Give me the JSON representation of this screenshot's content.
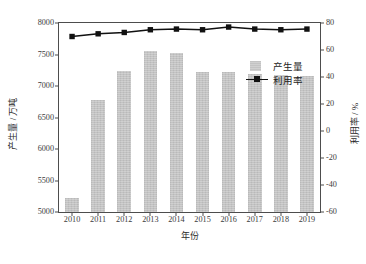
{
  "chart_data": {
    "type": "bar",
    "title": "",
    "subtitle": "",
    "xlabel": "年份",
    "ylabel": "产生量 / 万吨",
    "ylabel_secondary": "利用率 / %",
    "categories": [
      "2010",
      "2011",
      "2012",
      "2013",
      "2014",
      "2015",
      "2016",
      "2017",
      "2018",
      "2019"
    ],
    "ylim": [
      5000,
      8000
    ],
    "yticks": [
      5000,
      5500,
      6000,
      6500,
      7000,
      7500,
      8000
    ],
    "ylim_secondary": [
      -60,
      80
    ],
    "yticks_secondary": [
      -60,
      -40,
      -20,
      0,
      20,
      40,
      60,
      80
    ],
    "grid": false,
    "legend_position": "inside-upper-right",
    "series": [
      {
        "name": "产生量",
        "type": "bar",
        "axis": "left",
        "unit": "万吨",
        "color": "#c3c3c3",
        "values": [
          5230,
          6780,
          7240,
          7550,
          7520,
          7230,
          7215,
          7190,
          7180,
          7165
        ]
      },
      {
        "name": "利用率",
        "type": "line",
        "axis": "right",
        "unit": "%",
        "color": "#111111",
        "marker": "square",
        "values": [
          70,
          72,
          73,
          75,
          75.5,
          75,
          77,
          75.5,
          75,
          75.5
        ]
      }
    ]
  },
  "legend": {
    "items": [
      {
        "label": "产生量",
        "key": "bar-swatch"
      },
      {
        "label": "利用率",
        "key": "line-marker-swatch"
      }
    ]
  },
  "axes": {
    "left_title": "产生量 / 万吨",
    "right_title": "利用率 / %",
    "bottom_title": "年份"
  }
}
